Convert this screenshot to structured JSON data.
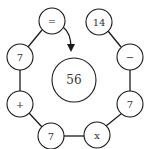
{
  "puzzle": {
    "center": {
      "label": "56",
      "x": 74,
      "y": 80,
      "r": 22
    },
    "ring": [
      {
        "id": "equals",
        "label": "=",
        "x": 52,
        "y": 21
      },
      {
        "id": "fourteen",
        "label": "14",
        "x": 99,
        "y": 22
      },
      {
        "id": "minus",
        "label": "−",
        "x": 130,
        "y": 57
      },
      {
        "id": "seven-right",
        "label": "7",
        "x": 130,
        "y": 104
      },
      {
        "id": "times",
        "label": "x",
        "x": 97,
        "y": 135
      },
      {
        "id": "seven-bottom",
        "label": "7",
        "x": 51,
        "y": 136
      },
      {
        "id": "plus",
        "label": "+",
        "x": 20,
        "y": 104
      },
      {
        "id": "seven-left",
        "label": "7",
        "x": 20,
        "y": 57
      }
    ],
    "node_radius": 13,
    "arrow": {
      "from": "equals",
      "to": "center",
      "direction": "clockwise-down"
    }
  }
}
